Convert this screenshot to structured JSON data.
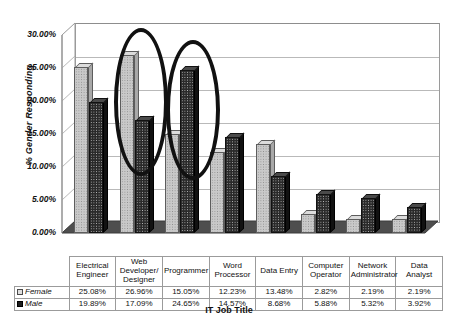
{
  "chart_data": {
    "type": "bar",
    "title": "",
    "xlabel": "IT Job Title",
    "ylabel": "% Gender Responding",
    "categories": [
      "Electrical Engineer",
      "Web Developer/ Designer",
      "Programmer",
      "Word Processor",
      "Data Entry",
      "Computer Operator",
      "Network Administrator",
      "Data Analyst"
    ],
    "series": [
      {
        "name": "Female",
        "values": [
          25.08,
          26.96,
          15.05,
          12.23,
          13.48,
          2.82,
          2.19,
          2.19
        ],
        "value_labels": [
          "25.08%",
          "26.96%",
          "15.05%",
          "12.23%",
          "13.48%",
          "2.82%",
          "2.19%",
          "2.19%"
        ]
      },
      {
        "name": "Male",
        "values": [
          19.89,
          17.09,
          24.65,
          14.57,
          8.68,
          5.88,
          5.32,
          3.92
        ],
        "value_labels": [
          "19.89%",
          "17.09%",
          "24.65%",
          "14.57%",
          "8.68%",
          "5.88%",
          "5.32%",
          "3.92%"
        ]
      }
    ],
    "ylim": [
      0,
      30
    ],
    "ytick_labels": [
      "30.00%",
      "25.00%",
      "20.00%",
      "15.00%",
      "10.00%",
      "5.00%",
      "0.00%"
    ],
    "ytick_values": [
      30,
      25,
      20,
      15,
      10,
      5,
      0
    ],
    "grid": true,
    "legend_position": "data-table",
    "annotations": [
      {
        "shape": "ellipse",
        "target": "Female / Web Developer/ Designer"
      },
      {
        "shape": "ellipse",
        "target": "Male / Programmer"
      }
    ]
  },
  "table": {
    "row_labels": [
      "Female",
      "Male"
    ]
  }
}
